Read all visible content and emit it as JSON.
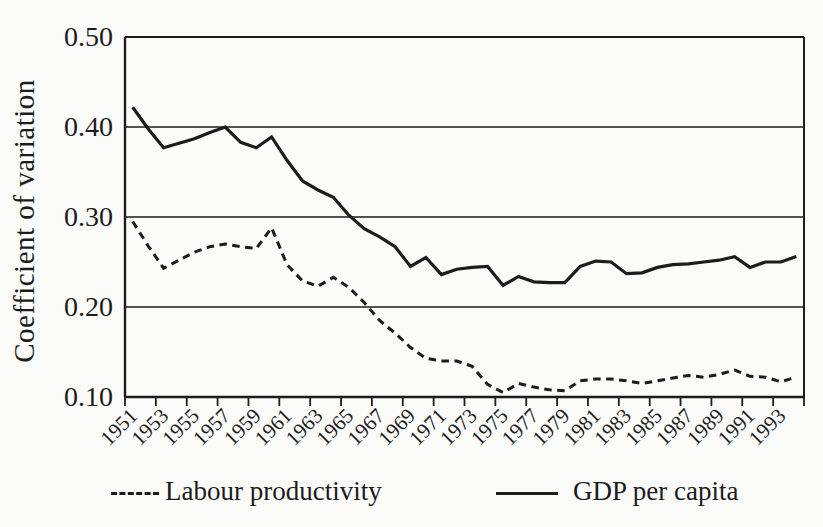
{
  "page": {
    "background": "#fbfbfa",
    "ink": "#1c1c1c"
  },
  "chart_data": {
    "type": "line",
    "title": "",
    "xlabel": "",
    "ylabel": "Coefficient of variation",
    "ylim": [
      0.1,
      0.5
    ],
    "yticks": [
      0.1,
      0.2,
      0.3,
      0.4,
      0.5
    ],
    "grid": "horizontal",
    "legend_position": "bottom",
    "x": [
      1951,
      1952,
      1953,
      1954,
      1955,
      1956,
      1957,
      1958,
      1959,
      1960,
      1961,
      1962,
      1963,
      1964,
      1965,
      1966,
      1967,
      1968,
      1969,
      1970,
      1971,
      1972,
      1973,
      1974,
      1975,
      1976,
      1977,
      1978,
      1979,
      1980,
      1981,
      1982,
      1983,
      1984,
      1985,
      1986,
      1987,
      1988,
      1989,
      1990,
      1991,
      1992,
      1993,
      1994
    ],
    "x_tick_labels": [
      "1951",
      "1953",
      "1955",
      "1957",
      "1959",
      "1961",
      "1963",
      "1965",
      "1967",
      "1969",
      "1971",
      "1973",
      "1975",
      "1977",
      "1979",
      "1981",
      "1983",
      "1985",
      "1987",
      "1989",
      "1991",
      "1993"
    ],
    "series": [
      {
        "name": "Labour productivity",
        "style": "dashed",
        "color": "#1c1c1c",
        "values": [
          0.295,
          0.268,
          0.243,
          0.252,
          0.261,
          0.267,
          0.27,
          0.267,
          0.265,
          0.288,
          0.247,
          0.229,
          0.223,
          0.233,
          0.222,
          0.205,
          0.185,
          0.171,
          0.155,
          0.143,
          0.14,
          0.14,
          0.134,
          0.114,
          0.105,
          0.115,
          0.111,
          0.108,
          0.107,
          0.118,
          0.12,
          0.12,
          0.118,
          0.115,
          0.118,
          0.121,
          0.124,
          0.122,
          0.125,
          0.13,
          0.123,
          0.122,
          0.117,
          0.122
        ]
      },
      {
        "name": "GDP per capita",
        "style": "solid",
        "color": "#1c1c1c",
        "values": [
          0.422,
          0.398,
          0.377,
          0.382,
          0.387,
          0.394,
          0.4,
          0.383,
          0.377,
          0.389,
          0.363,
          0.34,
          0.33,
          0.322,
          0.302,
          0.287,
          0.278,
          0.267,
          0.245,
          0.255,
          0.236,
          0.242,
          0.244,
          0.245,
          0.224,
          0.234,
          0.228,
          0.227,
          0.227,
          0.245,
          0.251,
          0.25,
          0.237,
          0.238,
          0.244,
          0.247,
          0.248,
          0.25,
          0.252,
          0.256,
          0.244,
          0.25,
          0.25,
          0.256
        ]
      }
    ]
  }
}
